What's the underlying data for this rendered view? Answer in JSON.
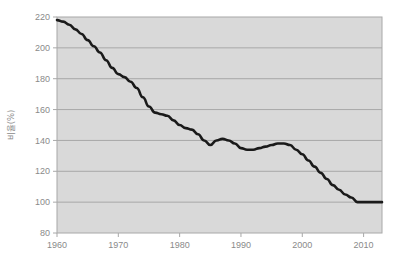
{
  "chart_data": {
    "type": "line",
    "title": "",
    "subtitle": "",
    "xlabel": "",
    "ylabel": "비율(%)",
    "xlim": [
      1960,
      2013
    ],
    "ylim": [
      80,
      220
    ],
    "xticks": [
      1960,
      1970,
      1980,
      1990,
      2000,
      2010
    ],
    "xtick_labels": [
      "1960",
      "1970",
      "1980",
      "1990",
      "2000",
      "2010"
    ],
    "yticks": [
      80,
      100,
      120,
      140,
      160,
      180,
      200,
      220
    ],
    "ytick_labels": [
      "80",
      "100",
      "120",
      "140",
      "160",
      "180",
      "200",
      "220"
    ],
    "grid": true,
    "grid_axis": "y",
    "legend": false,
    "legend_position": "none",
    "plot_bgcolor": "#d9d9d9",
    "grid_color": "#a8a8a8",
    "line_color": "#1a1a1a",
    "line_width": 2.6,
    "series": [
      {
        "name": "비율(%)",
        "x": [
          1960,
          1961,
          1962,
          1963,
          1964,
          1965,
          1966,
          1967,
          1968,
          1969,
          1970,
          1971,
          1972,
          1973,
          1974,
          1975,
          1976,
          1977,
          1978,
          1979,
          1980,
          1981,
          1982,
          1983,
          1984,
          1985,
          1986,
          1987,
          1988,
          1989,
          1990,
          1991,
          1992,
          1993,
          1994,
          1995,
          1996,
          1997,
          1998,
          1999,
          2000,
          2001,
          2002,
          2003,
          2004,
          2005,
          2006,
          2007,
          2008,
          2009,
          2010,
          2011,
          2012,
          2013
        ],
        "values": [
          218,
          217,
          215,
          212,
          209,
          205,
          201,
          197,
          192,
          187,
          183,
          181,
          178,
          174,
          168,
          162,
          158,
          157,
          156,
          153,
          150,
          148,
          147,
          144,
          140,
          137,
          140,
          141,
          140,
          138,
          135,
          134,
          134,
          135,
          136,
          137,
          138,
          138,
          137,
          134,
          131,
          127,
          123,
          119,
          115,
          111,
          108,
          105,
          103,
          100,
          100,
          100,
          100,
          100
        ]
      }
    ],
    "annotations": []
  },
  "axis": {
    "y_title": "비율(%)"
  }
}
